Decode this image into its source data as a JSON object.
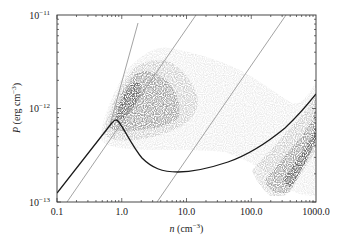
{
  "chart_data": {
    "type": "heatmap",
    "title": "",
    "xlabel": "n (cm^-3)",
    "ylabel": "P (erg cm^-3)",
    "xscale": "log",
    "yscale": "log",
    "xlim": [
      0.1,
      1000.0
    ],
    "ylim": [
      1e-13,
      1e-11
    ],
    "x_ticks": [
      "0.1",
      "1.0",
      "10.0",
      "100.0",
      "1000.0"
    ],
    "y_ticks": [
      "10^-13",
      "10^-12",
      "10^-11"
    ],
    "grid": false,
    "legend": null,
    "density_levels": [
      {
        "name": "lightest",
        "color": "#dcdcdc"
      },
      {
        "name": "light",
        "color": "#b4b4b4"
      },
      {
        "name": "medium",
        "color": "#7a7a7a"
      },
      {
        "name": "dark",
        "color": "#3c3c3c"
      }
    ],
    "thermal_equilibrium_curve": {
      "color": "#1a1a1a",
      "points": [
        [
          0.1,
          1.25e-13
        ],
        [
          0.3,
          3.2e-13
        ],
        [
          0.6,
          6.2e-13
        ],
        [
          0.8,
          7.8e-13
        ],
        [
          1.0,
          6.5e-13
        ],
        [
          1.5,
          4e-13
        ],
        [
          2.5,
          2.4e-13
        ],
        [
          4.0,
          1.8e-13
        ],
        [
          7.0,
          1.6e-13
        ],
        [
          12.0,
          1.65e-13
        ],
        [
          25.0,
          2.1e-13
        ],
        [
          60.0,
          3.6e-13
        ],
        [
          150.0,
          6.8e-13
        ],
        [
          400.0,
          1.4e-12
        ],
        [
          1000.0,
          2.8e-12
        ]
      ]
    },
    "isotherms": [
      {
        "name": "steep",
        "color": "#999999",
        "points": [
          [
            0.55,
            6e-13
          ],
          [
            1.4,
            9e-12
          ]
        ]
      },
      {
        "name": "isotherm-1",
        "color": "#999999",
        "points": [
          [
            0.14,
            1e-13
          ],
          [
            3.8,
            1e-11
          ]
        ]
      },
      {
        "name": "isotherm-2",
        "color": "#999999",
        "points": [
          [
            3.8,
            1e-13
          ],
          [
            92.0,
            1e-11
          ]
        ]
      }
    ]
  },
  "axes": {
    "x_tick_labels": [
      "0.1",
      "1.0",
      "10.0",
      "100.0",
      "1000.0"
    ],
    "y_tick_labels": [
      {
        "base": "10",
        "exp": "−11"
      },
      {
        "base": "10",
        "exp": "−12"
      },
      {
        "base": "10",
        "exp": "−13"
      }
    ],
    "xlabel_var": "n",
    "xlabel_unit": " (cm",
    "xlabel_exp": "−3",
    "xlabel_close": ")",
    "ylabel_var": "P",
    "ylabel_unit": " (erg cm",
    "ylabel_exp": "−3",
    "ylabel_close": ")"
  }
}
